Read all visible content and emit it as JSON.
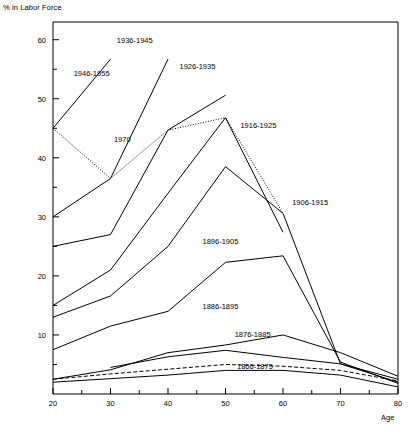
{
  "chart_data": {
    "type": "line",
    "title": "",
    "ylabel": "% in Labor Force",
    "xlabel": "Age",
    "xlim": [
      20,
      80
    ],
    "ylim": [
      0,
      63
    ],
    "grid": false,
    "legend_position": "inline-labels",
    "x_major_ticks": [
      20,
      30,
      40,
      50,
      60,
      70,
      80
    ],
    "x_minor_ticks": [
      25,
      35,
      45,
      55,
      65,
      75
    ],
    "y_major_ticks": [
      10,
      20,
      30,
      40,
      50,
      60
    ],
    "y_minor_ticks": [
      5,
      15,
      25,
      35,
      45,
      55
    ],
    "x_tick_labels": [
      "20",
      "30",
      "40",
      "50",
      "60",
      "70",
      "80"
    ],
    "y_tick_labels": [
      "10",
      "20",
      "30",
      "40",
      "50",
      "60"
    ],
    "series": [
      {
        "name": "1970",
        "style": "dotted",
        "label": "1970",
        "label_x": 30.6,
        "label_y": 42.6,
        "x": [
          20,
          30,
          40,
          50,
          60
        ],
        "values": [
          45.0,
          36.5,
          44.7,
          46.8,
          30.6
        ]
      },
      {
        "name": "1946-1955",
        "style": "solid",
        "label": "1946-1955",
        "label_x": 23.6,
        "label_y": 53.8,
        "x": [
          20,
          30
        ],
        "values": [
          45.0,
          56.7
        ]
      },
      {
        "name": "1936-1945",
        "style": "solid",
        "label": "1936-1945",
        "label_x": 31.1,
        "label_y": 59.4,
        "x": [
          20,
          30,
          40
        ],
        "values": [
          30.0,
          36.5,
          56.7
        ]
      },
      {
        "name": "1926-1935",
        "style": "solid",
        "label": "1926-1935",
        "label_x": 42.0,
        "label_y": 55.1,
        "x": [
          20,
          30,
          40,
          50
        ],
        "values": [
          25.0,
          27.0,
          44.7,
          50.6
        ]
      },
      {
        "name": "1916-1925",
        "style": "solid",
        "label": "1916-1925",
        "label_x": 52.6,
        "label_y": 45.0,
        "x": [
          20,
          30,
          40,
          50,
          60
        ],
        "values": [
          15.0,
          21.0,
          34.0,
          46.8,
          27.4
        ]
      },
      {
        "name": "1906-1915",
        "style": "solid",
        "label": "1906-1915",
        "label_x": 61.6,
        "label_y": 32.0,
        "x": [
          20,
          30,
          40,
          50,
          60,
          70,
          80
        ],
        "values": [
          13.0,
          16.6,
          25.0,
          38.5,
          30.6,
          5.1,
          2.0
        ]
      },
      {
        "name": "1896-1905",
        "style": "solid",
        "label": "1896-1905",
        "label_x": 46.0,
        "label_y": 25.4,
        "x": [
          20,
          30,
          40,
          50,
          60,
          70,
          80
        ],
        "values": [
          7.5,
          11.5,
          14.0,
          22.3,
          23.4,
          5.4,
          1.8
        ]
      },
      {
        "name": "1886-1895",
        "style": "solid",
        "label": "1886-1895",
        "label_x": 46.0,
        "label_y": 14.4,
        "x": [
          20,
          30,
          40,
          50,
          60,
          70,
          80
        ],
        "values": [
          2.5,
          4.1,
          7.0,
          8.3,
          10.0,
          7.0,
          3.0
        ]
      },
      {
        "name": "1876-1885",
        "style": "solid",
        "label": "1876-1885",
        "label_x": 51.6,
        "label_y": 9.7,
        "x": [
          30,
          40,
          50,
          60,
          70,
          80
        ],
        "values": [
          4.5,
          6.3,
          7.4,
          6.2,
          5.1,
          2.5
        ]
      },
      {
        "name": "1866-1875",
        "style": "dashed",
        "label": "1866-1875",
        "label_x": 52.0,
        "label_y": 4.2,
        "x": [
          20,
          30,
          40,
          50,
          60,
          70,
          80
        ],
        "values": [
          2.5,
          3.4,
          4.2,
          5.0,
          4.7,
          4.0,
          2.2
        ]
      },
      {
        "name": "lowest-unlabeled",
        "style": "solid",
        "label": "",
        "label_x": null,
        "label_y": null,
        "x": [
          20,
          30,
          40,
          50,
          60,
          70,
          80
        ],
        "values": [
          2.0,
          2.6,
          3.2,
          4.0,
          4.0,
          3.2,
          1.2
        ]
      }
    ]
  }
}
